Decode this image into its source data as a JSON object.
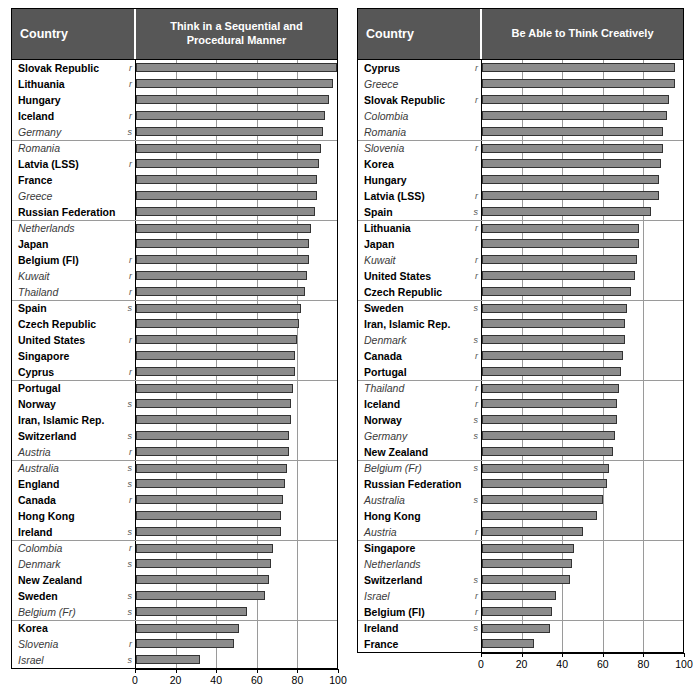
{
  "figure": {
    "panels": [
      {
        "id": "sequential",
        "country_header": "Country",
        "metric_header": "Think in a Sequential and Procedural Manner"
      },
      {
        "id": "creative",
        "country_header": "Country",
        "metric_header": "Be Able to Think Creatively"
      }
    ],
    "axis_ticks": [
      "0",
      "20",
      "40",
      "60",
      "80",
      "100"
    ]
  },
  "chart_data": [
    {
      "type": "bar",
      "orientation": "horizontal",
      "title": "Think in a Sequential and Procedural Manner",
      "xlabel": "",
      "ylabel": "Country",
      "xlim": [
        0,
        100
      ],
      "ticks": [
        0,
        20,
        40,
        60,
        80,
        100
      ],
      "grid": true,
      "legend": "none",
      "group_size": 5,
      "categories": [
        "Slovak Republic",
        "Lithuania",
        "Hungary",
        "Iceland",
        "Germany",
        "Romania",
        "Latvia (LSS)",
        "France",
        "Greece",
        "Russian Federation",
        "Netherlands",
        "Japan",
        "Belgium (Fl)",
        "Kuwait",
        "Thailand",
        "Spain",
        "Czech Republic",
        "United States",
        "Singapore",
        "Cyprus",
        "Portugal",
        "Norway",
        "Iran, Islamic Rep.",
        "Switzerland",
        "Austria",
        "Australia",
        "England",
        "Canada",
        "Hong Kong",
        "Ireland",
        "Colombia",
        "Denmark",
        "New Zealand",
        "Sweden",
        "Belgium (Fr)",
        "Korea",
        "Slovenia",
        "Israel"
      ],
      "values": [
        100,
        98,
        96,
        94,
        93,
        92,
        91,
        90,
        90,
        89,
        87,
        86,
        86,
        85,
        84,
        82,
        81,
        80,
        79,
        79,
        78,
        77,
        77,
        76,
        76,
        75,
        74,
        73,
        72,
        72,
        68,
        67,
        66,
        64,
        55,
        51,
        49,
        32
      ],
      "label_styles": [
        "bold",
        "bold",
        "bold",
        "bold",
        "italic",
        "italic",
        "bold",
        "bold",
        "italic",
        "bold",
        "italic",
        "bold",
        "bold",
        "italic",
        "italic",
        "bold",
        "bold",
        "bold",
        "bold",
        "bold",
        "bold",
        "bold",
        "bold",
        "bold",
        "italic",
        "italic",
        "bold",
        "bold",
        "bold",
        "bold",
        "italic",
        "italic",
        "bold",
        "bold",
        "italic",
        "bold",
        "italic",
        "italic"
      ],
      "flags": [
        "r",
        "r",
        "",
        "r",
        "s",
        "",
        "r",
        "",
        "",
        "",
        "",
        "",
        "r",
        "r",
        "r",
        "s",
        "",
        "r",
        "",
        "r",
        "",
        "s",
        "",
        "s",
        "r",
        "s",
        "s",
        "r",
        "",
        "s",
        "r",
        "s",
        "",
        "s",
        "s",
        "",
        "r",
        "s"
      ]
    },
    {
      "type": "bar",
      "orientation": "horizontal",
      "title": "Be Able to Think Creatively",
      "xlabel": "",
      "ylabel": "Country",
      "xlim": [
        0,
        100
      ],
      "ticks": [
        0,
        20,
        40,
        60,
        80,
        100
      ],
      "grid": true,
      "legend": "none",
      "group_size": 5,
      "categories": [
        "Cyprus",
        "Greece",
        "Slovak Republic",
        "Colombia",
        "Romania",
        "Slovenia",
        "Korea",
        "Hungary",
        "Latvia (LSS)",
        "Spain",
        "Lithuania",
        "Japan",
        "Kuwait",
        "United States",
        "Czech Republic",
        "Sweden",
        "Iran, Islamic Rep.",
        "Denmark",
        "Canada",
        "Portugal",
        "Thailand",
        "Iceland",
        "Norway",
        "Germany",
        "New Zealand",
        "Belgium (Fr)",
        "Russian Federation",
        "Australia",
        "Hong Kong",
        "Austria",
        "Singapore",
        "Netherlands",
        "Switzerland",
        "Israel",
        "Belgium (Fl)",
        "Ireland",
        "France"
      ],
      "values": [
        96,
        96,
        93,
        92,
        90,
        90,
        89,
        88,
        88,
        84,
        78,
        78,
        77,
        76,
        74,
        72,
        71,
        71,
        70,
        69,
        68,
        67,
        67,
        66,
        65,
        63,
        62,
        60,
        57,
        50,
        46,
        45,
        44,
        37,
        35,
        34,
        26
      ],
      "label_styles": [
        "bold",
        "italic",
        "bold",
        "italic",
        "italic",
        "italic",
        "bold",
        "bold",
        "bold",
        "bold",
        "bold",
        "bold",
        "italic",
        "bold",
        "bold",
        "bold",
        "bold",
        "italic",
        "bold",
        "bold",
        "italic",
        "bold",
        "bold",
        "italic",
        "bold",
        "italic",
        "bold",
        "italic",
        "bold",
        "italic",
        "bold",
        "italic",
        "bold",
        "italic",
        "bold",
        "bold",
        "bold"
      ],
      "flags": [
        "r",
        "",
        "r",
        "",
        "",
        "r",
        "",
        "",
        "r",
        "s",
        "r",
        "",
        "r",
        "r",
        "",
        "s",
        "",
        "s",
        "r",
        "",
        "r",
        "r",
        "s",
        "s",
        "",
        "s",
        "",
        "s",
        "",
        "r",
        "",
        "",
        "s",
        "r",
        "r",
        "s",
        ""
      ]
    }
  ]
}
